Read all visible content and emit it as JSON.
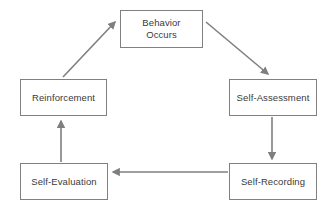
{
  "diagram": {
    "type": "cycle-flowchart",
    "background_color": "#ffffff",
    "box_border_color": "#808080",
    "box_fill_color": "#ffffff",
    "arrow_color": "#7f7f7f",
    "text_color": "#3a3a3a",
    "nodes": [
      {
        "id": "behavior",
        "label": "Behavior\nOccurs",
        "position": "top-center"
      },
      {
        "id": "self-assessment",
        "label": "Self-Assessment",
        "position": "middle-right"
      },
      {
        "id": "self-recording",
        "label": "Self-Recording",
        "position": "bottom-right"
      },
      {
        "id": "self-evaluation",
        "label": "Self-Evaluation",
        "position": "bottom-left"
      },
      {
        "id": "reinforcement",
        "label": "Reinforcement",
        "position": "middle-left"
      }
    ],
    "edges": [
      {
        "id": "behavior-to-assessment",
        "from": "behavior",
        "to": "self-assessment",
        "direction": "diagonal-down-right"
      },
      {
        "id": "assessment-to-recording",
        "from": "self-assessment",
        "to": "self-recording",
        "direction": "down"
      },
      {
        "id": "recording-to-evaluation",
        "from": "self-recording",
        "to": "self-evaluation",
        "direction": "left"
      },
      {
        "id": "evaluation-to-reinforcement",
        "from": "self-evaluation",
        "to": "reinforcement",
        "direction": "up"
      },
      {
        "id": "reinforcement-to-behavior",
        "from": "reinforcement",
        "to": "behavior",
        "direction": "diagonal-up-right"
      }
    ]
  }
}
